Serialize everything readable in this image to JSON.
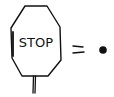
{
  "diagram": {
    "sign": {
      "shape": "octagon",
      "label": "STOP",
      "has_post": true
    },
    "operator": "=",
    "result": {
      "shape": "filled-dot"
    },
    "colors": {
      "stroke": "#111111",
      "background": "#ffffff"
    }
  }
}
